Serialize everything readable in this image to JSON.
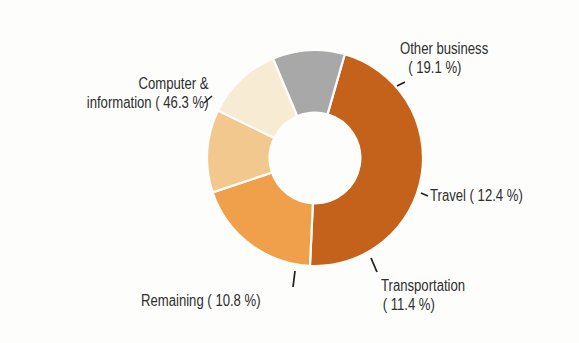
{
  "chart_data": {
    "type": "pie",
    "subtype": "donut",
    "title": "",
    "categories": [
      "Computer & information",
      "Other business",
      "Travel",
      "Transportation",
      "Remaining"
    ],
    "values": [
      46.3,
      19.1,
      12.4,
      11.4,
      10.8
    ],
    "unit": "%",
    "colors": [
      "#C4611A",
      "#F0A04A",
      "#F3C88E",
      "#F8EBD3",
      "#A8A8A8"
    ],
    "start_angle_deg_clockwise_from_top": 16,
    "inner_radius_ratio": 0.42,
    "legend": "none (direct labels with leader lines)"
  },
  "labels": {
    "computer": {
      "line1": "Computer &",
      "line2": "information ( 46.3 %)"
    },
    "other_business": {
      "line1": "Other business",
      "line2": "( 19.1 %)"
    },
    "travel": {
      "line1": "Travel ( 12.4 %)"
    },
    "transportation": {
      "line1": "Transportation",
      "line2": "( 11.4 %)"
    },
    "remaining": {
      "line1": "Remaining ( 10.8 %)"
    }
  },
  "style": {
    "leader_color": "#222222",
    "separator_color": "#fdfdfc"
  }
}
